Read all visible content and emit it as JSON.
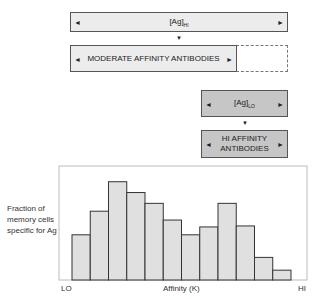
{
  "flow": {
    "ag_hi": {
      "main": "[Ag]",
      "sub": "HI"
    },
    "moderate": "MODERATE AFFINITY ANTIBODIES",
    "ag_lo": {
      "main": "[Ag]",
      "sub": "LO"
    },
    "hi_affinity": "HI AFFINITY ANTIBODIES",
    "colors": {
      "light_box": "#ececec",
      "dark_box": "#c6c6c6"
    }
  },
  "chart_data": {
    "type": "bar",
    "title": "",
    "xlabel": "Affinity (K)",
    "ylabel": "Fraction of memory cells specific for Ag",
    "x_tick_left": "LO",
    "x_tick_right": "HI",
    "categories": [
      "1",
      "2",
      "3",
      "4",
      "5",
      "6",
      "7",
      "8",
      "9",
      "10",
      "11",
      "12"
    ],
    "values": [
      0.46,
      0.7,
      1.0,
      0.89,
      0.78,
      0.61,
      0.46,
      0.54,
      0.78,
      0.55,
      0.23,
      0.1
    ],
    "ylim": [
      0,
      1.16
    ],
    "grid": false,
    "bar_color": "#e0e0e0"
  }
}
